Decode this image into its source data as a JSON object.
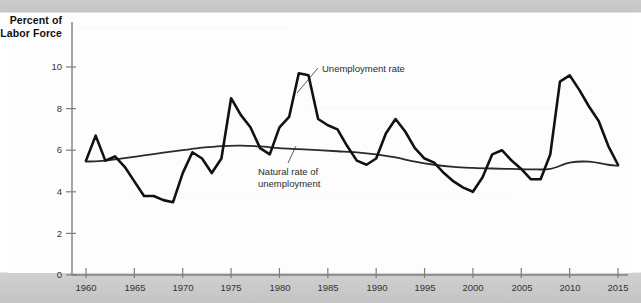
{
  "figure": {
    "background_color": "#fdfdfd",
    "frame_color": "#c7c7c7",
    "y_axis_title_line1": "Percent of",
    "y_axis_title_line2": "Labor Force"
  },
  "annotations": {
    "unemployment_label": "Unemployment rate",
    "natural_label_line1": "Natural rate of",
    "natural_label_line2": "unemployment"
  },
  "chart_data": {
    "type": "line",
    "title": "",
    "subtitle": "",
    "xlabel": "",
    "ylabel": "Percent of Labor Force",
    "xlim": [
      1959,
      2015.5
    ],
    "ylim": [
      0,
      11.2
    ],
    "xticks": [
      1960,
      1965,
      1970,
      1975,
      1980,
      1985,
      1990,
      1995,
      2000,
      2005,
      2010,
      2015
    ],
    "yticks": [
      0,
      2,
      4,
      6,
      8,
      10
    ],
    "xtick_labels": [
      "1960",
      "1965",
      "1970",
      "1975",
      "1980",
      "1985",
      "1990",
      "1995",
      "2000",
      "2005",
      "2010",
      "2015"
    ],
    "ytick_labels": [
      "0",
      "2",
      "4",
      "6",
      "8",
      "10"
    ],
    "grid": false,
    "legend": "annotated-inline",
    "series": [
      {
        "name": "Unemployment rate",
        "color": "#111111",
        "width": 2.6,
        "x": [
          1960,
          1961,
          1962,
          1963,
          1964,
          1965,
          1966,
          1967,
          1968,
          1969,
          1970,
          1971,
          1972,
          1973,
          1974,
          1975,
          1976,
          1977,
          1978,
          1979,
          1980,
          1981,
          1982,
          1983,
          1984,
          1985,
          1986,
          1987,
          1988,
          1989,
          1990,
          1991,
          1992,
          1993,
          1994,
          1995,
          1996,
          1997,
          1998,
          1999,
          2000,
          2001,
          2002,
          2003,
          2004,
          2005,
          2006,
          2007,
          2008,
          2009,
          2010,
          2011,
          2012,
          2013,
          2014,
          2015
        ],
        "y": [
          5.5,
          6.7,
          5.5,
          5.7,
          5.2,
          4.5,
          3.8,
          3.8,
          3.6,
          3.5,
          4.9,
          5.9,
          5.6,
          4.9,
          5.6,
          8.5,
          7.7,
          7.1,
          6.1,
          5.8,
          7.1,
          7.6,
          9.7,
          9.6,
          7.5,
          7.2,
          7.0,
          6.2,
          5.5,
          5.3,
          5.6,
          6.8,
          7.5,
          6.9,
          6.1,
          5.6,
          5.4,
          4.9,
          4.5,
          4.2,
          4.0,
          4.7,
          5.8,
          6.0,
          5.5,
          5.1,
          4.6,
          4.6,
          5.8,
          9.3,
          9.6,
          8.9,
          8.1,
          7.4,
          6.2,
          5.3
        ]
      },
      {
        "name": "Natural rate of unemployment",
        "color": "#2a2a2a",
        "width": 1.8,
        "x": [
          1960,
          1962,
          1964,
          1966,
          1968,
          1970,
          1972,
          1974,
          1976,
          1978,
          1980,
          1982,
          1984,
          1986,
          1988,
          1990,
          1992,
          1994,
          1996,
          1998,
          2000,
          2002,
          2004,
          2006,
          2008,
          2010,
          2012,
          2014,
          2015
        ],
        "y": [
          5.45,
          5.5,
          5.62,
          5.75,
          5.88,
          6.0,
          6.12,
          6.2,
          6.22,
          6.18,
          6.1,
          6.05,
          6.0,
          5.95,
          5.9,
          5.8,
          5.65,
          5.45,
          5.3,
          5.2,
          5.15,
          5.12,
          5.1,
          5.08,
          5.1,
          5.4,
          5.45,
          5.3,
          5.25
        ]
      }
    ]
  }
}
